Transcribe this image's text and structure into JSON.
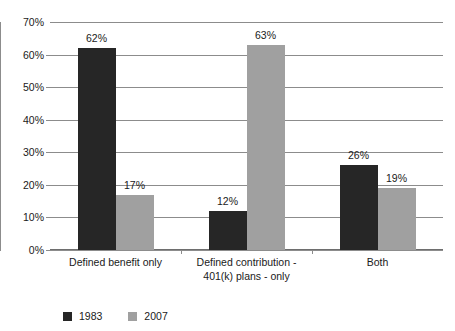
{
  "chart_data": {
    "type": "bar",
    "title": "",
    "subtitle": "",
    "xlabel": "",
    "ylabel": "",
    "ylim": [
      0,
      70
    ],
    "y_tick_labels": [
      "70%",
      "60%",
      "50%",
      "40%",
      "30%",
      "20%",
      "10%",
      "0%"
    ],
    "y_tick_values": [
      70,
      60,
      50,
      40,
      30,
      20,
      10,
      0
    ],
    "grid": true,
    "legend_position": "bottom-left",
    "categories": [
      "Defined benefit only",
      "Defined contribution - 401(k) plans - only",
      "Both"
    ],
    "category_lines": [
      [
        "Defined benefit only"
      ],
      [
        "Defined contribution -",
        "401(k) plans - only"
      ],
      [
        "Both"
      ]
    ],
    "series": [
      {
        "name": "1983",
        "color": "#262626",
        "values": [
          62,
          12,
          26
        ],
        "value_labels": [
          "62%",
          "12%",
          "26%"
        ]
      },
      {
        "name": "2007",
        "color": "#a0a0a0",
        "values": [
          17,
          63,
          19
        ],
        "value_labels": [
          "17%",
          "63%",
          "19%"
        ]
      }
    ]
  },
  "legend": {
    "entries": [
      {
        "label": "1983",
        "color": "#262626"
      },
      {
        "label": "2007",
        "color": "#a0a0a0"
      }
    ]
  },
  "colors": {
    "series_1983": "#262626",
    "series_2007": "#a0a0a0",
    "gridline": "#8c8c8c",
    "axis": "#6e6e6e",
    "text": "#1a1a1a",
    "background": "#ffffff"
  }
}
